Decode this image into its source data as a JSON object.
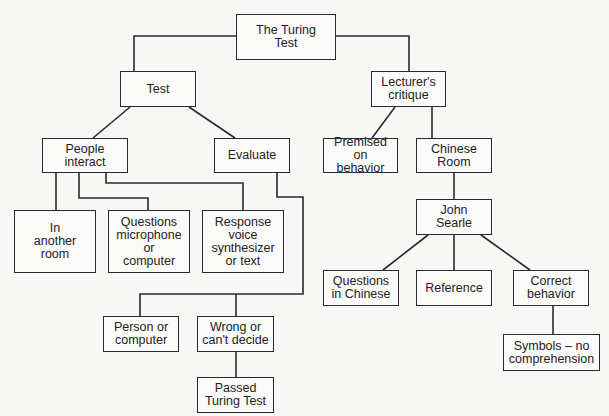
{
  "diagram": {
    "title": "The Turing Test",
    "nodes": {
      "root": "The Turing\nTest",
      "test": "Test",
      "people_interact": "People\ninteract",
      "evaluate": "Evaluate",
      "another_room": "In\nanother\nroom",
      "questions_mic": "Questions\nmicrophone\nor\ncomputer",
      "response_voice": "Response\nvoice\nsynthesizer\nor text",
      "person_or_computer": "Person or\ncomputer",
      "wrong_or_cant_decide": "Wrong or\ncan't decide",
      "passed": "Passed\nTuring Test",
      "lecturers_critique": "Lecturer's\ncritique",
      "premised_on_behavior": "Premised on\nbehavior",
      "chinese_room": "Chinese\nRoom",
      "john_searle": "John\nSearle",
      "questions_in_chinese": "Questions\nin Chinese",
      "reference": "Reference",
      "correct_behavior": "Correct\nbehavior",
      "symbols_no_comprehension": "Symbols – no\ncomprehension"
    },
    "edges": [
      [
        "root",
        "test"
      ],
      [
        "root",
        "lecturers_critique"
      ],
      [
        "test",
        "people_interact"
      ],
      [
        "test",
        "evaluate"
      ],
      [
        "people_interact",
        "another_room"
      ],
      [
        "people_interact",
        "questions_mic"
      ],
      [
        "people_interact",
        "response_voice"
      ],
      [
        "evaluate",
        "person_or_computer"
      ],
      [
        "evaluate",
        "wrong_or_cant_decide"
      ],
      [
        "wrong_or_cant_decide",
        "passed"
      ],
      [
        "lecturers_critique",
        "premised_on_behavior"
      ],
      [
        "lecturers_critique",
        "chinese_room"
      ],
      [
        "chinese_room",
        "john_searle"
      ],
      [
        "john_searle",
        "questions_in_chinese"
      ],
      [
        "john_searle",
        "reference"
      ],
      [
        "john_searle",
        "correct_behavior"
      ],
      [
        "correct_behavior",
        "symbols_no_comprehension"
      ]
    ],
    "colors": {
      "line": "#2a2a2a",
      "background": "#f7f7f6",
      "box_fill": "#fbfbfa"
    }
  }
}
